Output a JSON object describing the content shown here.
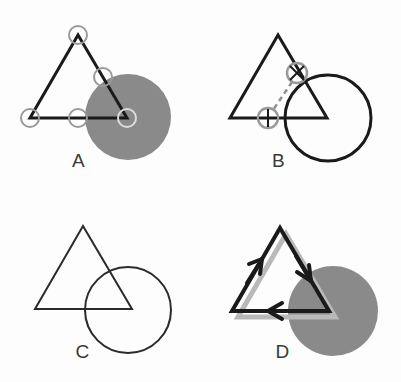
{
  "figure": {
    "width": 401,
    "height": 382,
    "background_color": "#fdfdfd",
    "stroke_color": "#1a1a1a",
    "gray_fill_color": "#8a8a8a",
    "marker_ring_color": "#9a9a9a",
    "shadow_color": "#b9b9b9",
    "label_color": "#3a3a3a"
  },
  "panels": [
    {
      "id": "A",
      "label": "A",
      "description": "Outlined triangle overlapping a solid gray disk, with small open ring markers at the three triangle vertices plus two edge-midpoint markers",
      "shapes": {
        "disk": {
          "cx": 128,
          "cy": 117,
          "r": 43,
          "fill": "#8a8a8a"
        },
        "triangle": {
          "apex": [
            78,
            35
          ],
          "left": [
            30,
            118
          ],
          "right": [
            127,
            118
          ],
          "stroke_width": 3
        },
        "markers": [
          {
            "cx": 78,
            "cy": 35,
            "r": 9,
            "name": "vertex-apex"
          },
          {
            "cx": 30,
            "cy": 118,
            "r": 9,
            "name": "vertex-bottom-left"
          },
          {
            "cx": 127,
            "cy": 118,
            "r": 9,
            "name": "vertex-bottom-right"
          },
          {
            "cx": 78,
            "cy": 118,
            "r": 9,
            "name": "midpoint-bottom-edge"
          },
          {
            "cx": 103,
            "cy": 77,
            "r": 9,
            "name": "midpoint-right-edge"
          }
        ]
      }
    },
    {
      "id": "B",
      "label": "B",
      "description": "Outlined triangle overlapping an outlined circle, with two crosshair ring markers at intersection points joined by a short dashed segment",
      "shapes": {
        "circle": {
          "cx": 128,
          "cy": 118,
          "r": 43,
          "stroke_width": 3,
          "fill": "none"
        },
        "triangle": {
          "apex": [
            78,
            35
          ],
          "left": [
            30,
            118
          ],
          "right": [
            127,
            118
          ],
          "stroke_width": 3
        },
        "markers": [
          {
            "cx": 97,
            "cy": 73,
            "r": 10,
            "name": "intersection-upper",
            "crosshair": true
          },
          {
            "cx": 68,
            "cy": 118,
            "r": 10,
            "name": "intersection-lower",
            "crosshair": true
          }
        ],
        "dashed_link": {
          "x1": 92,
          "y1": 82,
          "x2": 73,
          "y2": 110,
          "dash": "5 4"
        }
      }
    },
    {
      "id": "C",
      "label": "C",
      "description": "Plain outlined triangle overlapping a plain outlined circle, no markers",
      "shapes": {
        "circle": {
          "cx": 128,
          "cy": 310,
          "r": 43,
          "stroke_width": 2,
          "fill": "none"
        },
        "triangle": {
          "apex": [
            83,
            226
          ],
          "left": [
            35,
            309
          ],
          "right": [
            132,
            309
          ],
          "stroke_width": 2
        }
      }
    },
    {
      "id": "D",
      "label": "D",
      "description": "Bold outlined triangle with counter-clockwise direction arrows on each edge, overlapping a solid gray disk, with a soft gray drop shadow offset down-right",
      "shapes": {
        "disk": {
          "cx": 133,
          "cy": 311,
          "r": 45,
          "fill": "#8a8a8a"
        },
        "shadow": {
          "offset_x": 6,
          "offset_y": 6,
          "color": "#b9b9b9"
        },
        "triangle": {
          "apex": [
            80,
            228
          ],
          "left": [
            32,
            311
          ],
          "right": [
            129,
            311
          ],
          "stroke_width": 4
        },
        "arrows": [
          {
            "name": "arrow-left-edge-upward",
            "at": [
              56,
              269
            ],
            "direction": "up-right-along-left-edge"
          },
          {
            "name": "arrow-right-edge-downward",
            "at": [
              105,
              270
            ],
            "direction": "down-right-along-right-edge"
          },
          {
            "name": "arrow-bottom-edge-left",
            "at": [
              80,
              311
            ],
            "direction": "leftward-along-bottom-edge"
          }
        ]
      }
    }
  ]
}
